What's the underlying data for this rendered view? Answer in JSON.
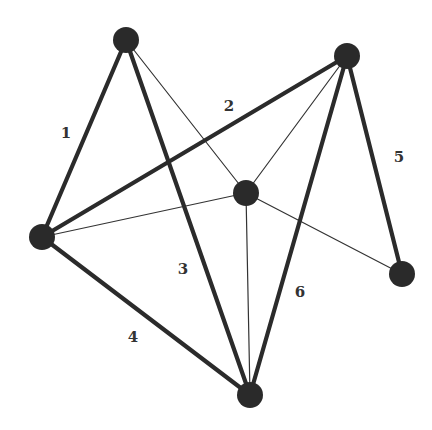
{
  "diagram": {
    "type": "graph",
    "colors": {
      "edge": "#2b2b2b",
      "node": "#2a2a2a",
      "label": "#333333",
      "background": "#ffffff"
    },
    "nodes": [
      {
        "id": "top",
        "x": 126,
        "y": 40,
        "r": 13
      },
      {
        "id": "top-right",
        "x": 347,
        "y": 56,
        "r": 13
      },
      {
        "id": "center",
        "x": 246,
        "y": 193,
        "r": 13
      },
      {
        "id": "left",
        "x": 42,
        "y": 237,
        "r": 13
      },
      {
        "id": "right",
        "x": 402,
        "y": 274,
        "r": 13
      },
      {
        "id": "bottom",
        "x": 250,
        "y": 395,
        "r": 13
      }
    ],
    "labeled_edges": [
      {
        "label": "1",
        "from": "top",
        "to": "left",
        "label_x": 66,
        "label_y": 133
      },
      {
        "label": "2",
        "from": "top-right",
        "to": "left",
        "label_x": 229,
        "label_y": 106
      },
      {
        "label": "3",
        "from": "top",
        "to": "bottom",
        "label_x": 183,
        "label_y": 269
      },
      {
        "label": "4",
        "from": "left",
        "to": "bottom",
        "label_x": 133,
        "label_y": 337
      },
      {
        "label": "5",
        "from": "top-right",
        "to": "right",
        "label_x": 399,
        "label_y": 157
      },
      {
        "label": "6",
        "from": "top-right",
        "to": "bottom",
        "label_x": 300,
        "label_y": 292
      }
    ],
    "thin_edges": [
      {
        "from": "center",
        "to": "top"
      },
      {
        "from": "center",
        "to": "top-right"
      },
      {
        "from": "center",
        "to": "left"
      },
      {
        "from": "center",
        "to": "right"
      },
      {
        "from": "center",
        "to": "bottom"
      }
    ]
  }
}
